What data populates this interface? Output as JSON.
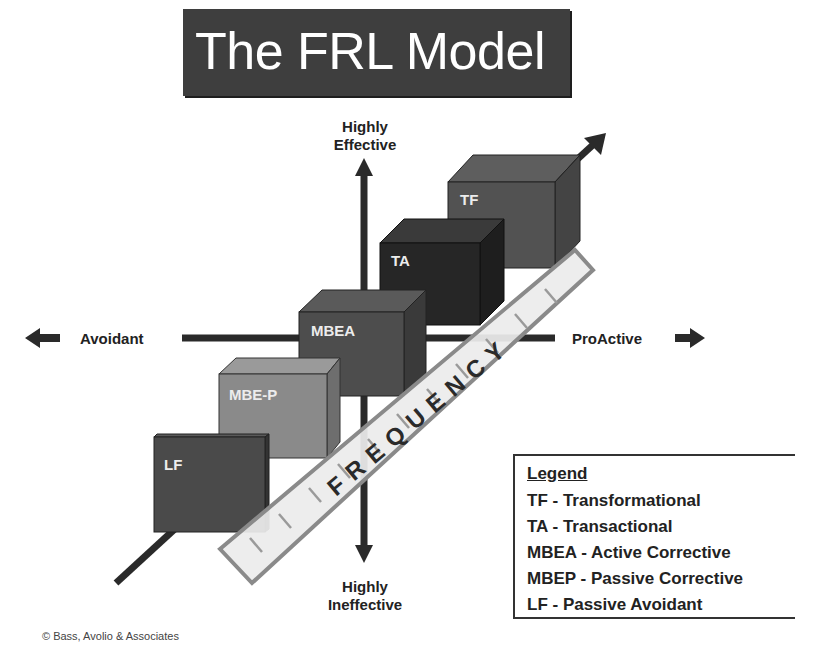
{
  "title": "The FRL Model",
  "axes": {
    "top": [
      "Highly",
      "Effective"
    ],
    "bottom": [
      "Highly",
      "Ineffective"
    ],
    "left": "Avoidant",
    "right": "ProActive",
    "diagonal": "FREQUENCY"
  },
  "boxes": [
    {
      "id": "LF",
      "label": "LF",
      "color": "#4a4a4a"
    },
    {
      "id": "MBE-P",
      "label": "MBE-P",
      "color": "#8a8a8a"
    },
    {
      "id": "MBEA",
      "label": "MBEA",
      "color": "#4d4d4d"
    },
    {
      "id": "TA",
      "label": "TA",
      "color": "#262626"
    },
    {
      "id": "TF",
      "label": "TF",
      "color": "#525252"
    }
  ],
  "legend": {
    "title": "Legend",
    "items": [
      "TF - Transformational",
      "TA - Transactional",
      "MBEA - Active Corrective",
      "MBEP - Passive Corrective",
      "LF - Passive Avoidant"
    ]
  },
  "copyright": "© Bass, Avolio & Associates"
}
